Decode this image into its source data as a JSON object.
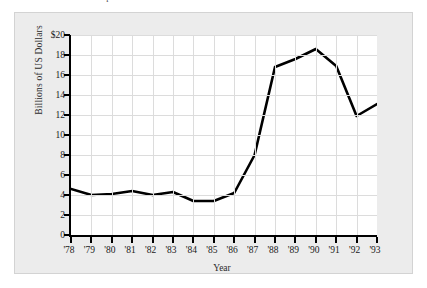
{
  "figure": {
    "caption": "FIGURE 3-4   Growth of Japanese direct investment",
    "plate_color": "#ececec",
    "plot_background": "#ffffff",
    "axis_color": "#000000",
    "grid_color": "#dcdcdc",
    "line_color": "#000000"
  },
  "chart_data": {
    "type": "line",
    "title": "",
    "xlabel": "Year",
    "ylabel": "Billions of US Dollars",
    "categories": [
      "'78",
      "'79",
      "'80",
      "'81",
      "'82",
      "'83",
      "'84",
      "'85",
      "'86",
      "'87",
      "'88",
      "'89",
      "'90",
      "'91",
      "'92",
      "'93"
    ],
    "values": [
      4.6,
      4.0,
      4.1,
      4.4,
      4.0,
      4.3,
      3.4,
      3.4,
      4.2,
      8.0,
      16.8,
      17.6,
      18.6,
      16.9,
      11.9,
      13.1
    ],
    "ytick_labels": [
      "$20",
      "18",
      "16",
      "14",
      "12",
      "10",
      "8",
      "6",
      "4",
      "2",
      "0"
    ],
    "ytick_values": [
      20,
      18,
      16,
      14,
      12,
      10,
      8,
      6,
      4,
      2,
      0
    ],
    "ylim": [
      0,
      20
    ],
    "grid": true,
    "legend": "none",
    "series_name": "Japanese direct investment"
  }
}
